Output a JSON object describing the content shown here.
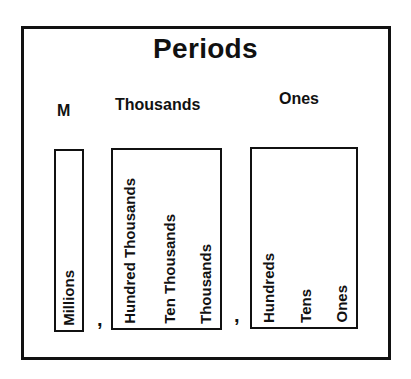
{
  "title": "Periods",
  "periods": [
    {
      "label": "M",
      "places": [
        "Millions"
      ]
    },
    {
      "label": "Thousands",
      "places": [
        "Hundred Thousands",
        "Ten Thousands",
        "Thousands"
      ]
    },
    {
      "label": "Ones",
      "places": [
        "Hundreds",
        "Tens",
        "Ones"
      ]
    }
  ],
  "separators": [
    ",",
    ","
  ]
}
